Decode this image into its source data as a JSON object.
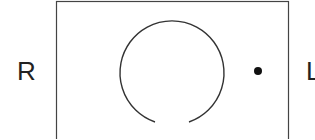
{
  "diagram": {
    "labels": {
      "left": "R",
      "right": "L"
    },
    "frame": {
      "x": 56,
      "y": 1,
      "width": 232,
      "height": 150,
      "stroke": "#444444"
    },
    "ring": {
      "cx": 172,
      "cy": 71,
      "r": 52,
      "gap_position": "bottom",
      "stroke": "#333333"
    },
    "dot": {
      "cx": 258,
      "cy": 71,
      "r": 4,
      "fill": "#111111"
    }
  }
}
